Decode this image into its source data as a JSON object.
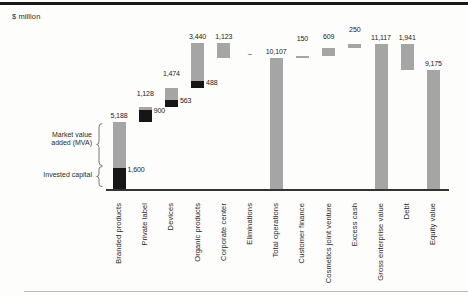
{
  "page": {
    "unit_label": "$ million"
  },
  "annotations": {
    "market_value_line1": "Market value",
    "market_value_line2": "added (MVA)",
    "invested_capital": "Invested capital"
  },
  "colors": {
    "bar_gray": "#a5a5a5",
    "bar_black": "#161616",
    "axis": "#333333",
    "top_rule": "#191919",
    "bottom_rule": "#bdbdbd",
    "text": "#1c1c1c"
  },
  "chart_data": {
    "type": "bar",
    "subtype": "waterfall",
    "title": "",
    "unit": "$ million",
    "ylabel": "$ million",
    "ylim": [
      0,
      11230
    ],
    "grid": false,
    "legend": "none",
    "segment_meaning": {
      "gray": "Market value added (MVA)",
      "black": "Invested capital"
    },
    "categories": [
      "Branded products",
      "Private label",
      "Devices",
      "Organic products",
      "Corporate center",
      "Eliminations",
      "Total operations",
      "Customer finance",
      "Cosmetics joint venture",
      "Excess cash",
      "Gross enterprise value",
      "Debt",
      "Equity value"
    ],
    "bars": [
      {
        "label": "Branded products",
        "start": 0,
        "end": 5188,
        "value_label": "5,188",
        "invested_capital": {
          "from": 0,
          "to": 1600,
          "label": "1,600"
        }
      },
      {
        "label": "Private label",
        "start": 5188,
        "end": 6316,
        "value_label": "1,128",
        "label_raise": -7,
        "invested_capital": {
          "from": 5188,
          "to": 6088,
          "label": "900"
        }
      },
      {
        "label": "Devices",
        "start": 6316,
        "end": 7790,
        "value_label": "1,474",
        "label_raise": -8,
        "invested_capital": {
          "from": 6316,
          "to": 6879,
          "label": "563"
        }
      },
      {
        "label": "Organic products",
        "start": 7790,
        "end": 11230,
        "value_label": "3,440",
        "invested_capital": {
          "from": 7790,
          "to": 8278,
          "label": "488"
        }
      },
      {
        "label": "Corporate center",
        "start": 11230,
        "end": 10107,
        "value_label": "1,123"
      },
      {
        "label": "Eliminations",
        "start": 10107,
        "end": 10107,
        "value_label": "–",
        "label_raise": 2
      },
      {
        "label": "Total operations",
        "start": 0,
        "end": 10107,
        "value_label": "10,107"
      },
      {
        "label": "Customer finance",
        "start": 10107,
        "end": 10257,
        "value_label": "150",
        "label_raise": -11
      },
      {
        "label": "Cosmetics joint venture",
        "start": 10257,
        "end": 10866,
        "value_label": "609",
        "label_raise": -5
      },
      {
        "label": "Excess cash",
        "start": 10866,
        "end": 11116,
        "value_label": "250",
        "label_raise": -8
      },
      {
        "label": "Gross enterprise value",
        "start": 0,
        "end": 11117,
        "value_label": "11,117"
      },
      {
        "label": "Debt",
        "start": 11117,
        "end": 9176,
        "value_label": "1,941"
      },
      {
        "label": "Equity value",
        "start": 0,
        "end": 9175,
        "value_label": "9,175"
      }
    ]
  }
}
